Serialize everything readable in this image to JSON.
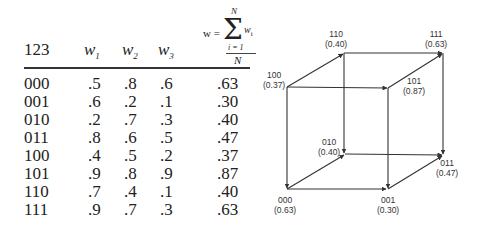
{
  "table": {
    "headers": {
      "col0": "123",
      "col1": "w",
      "col1_sub": "1",
      "col2": "w",
      "col2_sub": "2",
      "col3": "w",
      "col3_sub": "3"
    },
    "formula": {
      "lhs": "w =",
      "sigma": "Σ",
      "upper": "N",
      "lower": "i = 1",
      "term": "w",
      "term_sub": "i",
      "denominator": "N"
    },
    "rows": [
      {
        "code": "000",
        "w1": ".5",
        "w2": ".8",
        "w3": ".6",
        "w": ".63"
      },
      {
        "code": "001",
        "w1": ".6",
        "w2": ".2",
        "w3": ".1",
        "w": ".30"
      },
      {
        "code": "010",
        "w1": ".2",
        "w2": ".7",
        "w3": ".3",
        "w": ".40"
      },
      {
        "code": "011",
        "w1": ".8",
        "w2": ".6",
        "w3": ".5",
        "w": ".47"
      },
      {
        "code": "100",
        "w1": ".4",
        "w2": ".5",
        "w3": ".2",
        "w": ".37"
      },
      {
        "code": "101",
        "w1": ".9",
        "w2": ".8",
        "w3": ".9",
        "w": ".87"
      },
      {
        "code": "110",
        "w1": ".7",
        "w2": ".4",
        "w3": ".1",
        "w": ".40"
      },
      {
        "code": "111",
        "w1": ".9",
        "w2": ".7",
        "w3": ".3",
        "w": ".63"
      }
    ]
  },
  "cube": {
    "vertices": [
      {
        "code": "000",
        "value": "(0.63)"
      },
      {
        "code": "001",
        "value": "(0.30)"
      },
      {
        "code": "010",
        "value": "(0.40)"
      },
      {
        "code": "011",
        "value": "(0.47)"
      },
      {
        "code": "100",
        "value": "(0.37)"
      },
      {
        "code": "101",
        "value": "(0.87)"
      },
      {
        "code": "110",
        "value": "(0.40)"
      },
      {
        "code": "111",
        "value": "(0.63)"
      }
    ],
    "line_color": "#333333"
  }
}
